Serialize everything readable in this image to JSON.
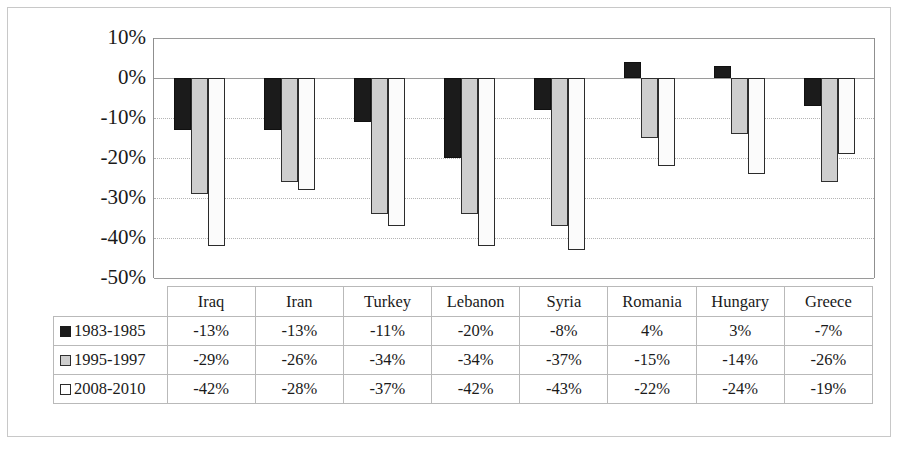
{
  "chart_data": {
    "type": "bar",
    "title": "",
    "subtitle": "",
    "xlabel": "",
    "ylabel": "",
    "grid": true,
    "legend_position": "table-left",
    "ylim": [
      -50,
      10
    ],
    "ytick_step": 10,
    "ytick_labels": [
      "10%",
      "0%",
      "-10%",
      "-20%",
      "-30%",
      "-40%",
      "-50%"
    ],
    "ytick_values": [
      10,
      0,
      -10,
      -20,
      -30,
      -40,
      -50
    ],
    "categories": [
      "Iraq",
      "Iran",
      "Turkey",
      "Lebanon",
      "Syria",
      "Romania",
      "Hungary",
      "Greece"
    ],
    "series": [
      {
        "name": "1983-1985",
        "color": "#1b1b1b",
        "marker": "filled-square",
        "values": [
          -13,
          -13,
          -11,
          -20,
          -8,
          4,
          3,
          -7
        ],
        "labels": [
          "-13%",
          "-13%",
          "-11%",
          "-20%",
          "-8%",
          "4%",
          "3%",
          "-7%"
        ]
      },
      {
        "name": "1995-1997",
        "color": "#cecece",
        "marker": "gray-square",
        "values": [
          -29,
          -26,
          -34,
          -34,
          -37,
          -15,
          -14,
          -26
        ],
        "labels": [
          "-29%",
          "-26%",
          "-34%",
          "-34%",
          "-37%",
          "-15%",
          "-14%",
          "-26%"
        ]
      },
      {
        "name": "2008-2010",
        "color": "#ffffff",
        "marker": "open-square",
        "values": [
          -42,
          -28,
          -37,
          -42,
          -43,
          -22,
          -24,
          -19
        ],
        "labels": [
          "-42%",
          "-28%",
          "-37%",
          "-42%",
          "-43%",
          "-22%",
          "-24%",
          "-19%"
        ]
      }
    ]
  },
  "table": {
    "corner_label": "",
    "column_headers": [
      "Iraq",
      "Iran",
      "Turkey",
      "Lebanon",
      "Syria",
      "Romania",
      "Hungary",
      "Greece"
    ],
    "rows": [
      {
        "label": "1983-1985",
        "swatch": "filled-square",
        "cells": [
          "-13%",
          "-13%",
          "-11%",
          "-20%",
          "-8%",
          "4%",
          "3%",
          "-7%"
        ]
      },
      {
        "label": "1995-1997",
        "swatch": "gray-square",
        "cells": [
          "-29%",
          "-26%",
          "-34%",
          "-34%",
          "-37%",
          "-15%",
          "-14%",
          "-26%"
        ]
      },
      {
        "label": "2008-2010",
        "swatch": "open-square",
        "cells": [
          "-42%",
          "-28%",
          "-37%",
          "-42%",
          "-43%",
          "-22%",
          "-24%",
          "-19%"
        ]
      }
    ]
  }
}
